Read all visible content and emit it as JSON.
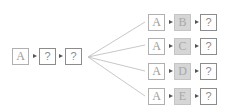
{
  "diagram": {
    "source_sequence": [
      "A",
      "?",
      "?"
    ],
    "branches": [
      {
        "tokens": [
          "A",
          "B",
          "?"
        ],
        "highlighted_index": 1
      },
      {
        "tokens": [
          "A",
          "C",
          "?"
        ],
        "highlighted_index": 1
      },
      {
        "tokens": [
          "A",
          "D",
          "?"
        ],
        "highlighted_index": 1
      },
      {
        "tokens": [
          "A",
          "E",
          "?"
        ],
        "highlighted_index": 1
      }
    ],
    "colors": {
      "box_border": "#b0b0b0",
      "highlight_fill": "#d6d6d6",
      "arrow": "#555555",
      "connector": "#c8c8c8"
    }
  }
}
